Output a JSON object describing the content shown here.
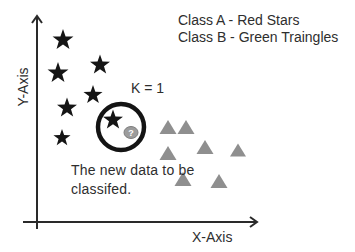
{
  "legend": {
    "class_a": "Class A - Red Stars",
    "class_b": "Class B - Green Traingles"
  },
  "annotations": {
    "k_label": "K = 1",
    "note_line1": "The new data to be",
    "note_line2": "classifed."
  },
  "axes": {
    "x_label": "X-Axis",
    "y_label": "Y-Axis",
    "vertical": {
      "x": 37,
      "top": 16,
      "bottom": 229
    },
    "horizontal": {
      "y": 222,
      "left": 23,
      "right": 257
    }
  },
  "colors": {
    "background": "#ffffff",
    "star": "#151515",
    "triangle": "#8f8f8f",
    "axis": "#2a2a2a",
    "text": "#2e2e2e",
    "circle_stroke": "#141414",
    "badge_fill": "#9c9c9c",
    "badge_stroke": "#7d7d7d",
    "badge_text": "#ffffff"
  },
  "markers": {
    "stars": [
      {
        "x": 63,
        "y": 40,
        "r": 11
      },
      {
        "x": 100,
        "y": 65,
        "r": 10.5
      },
      {
        "x": 58,
        "y": 73,
        "r": 11
      },
      {
        "x": 93,
        "y": 95,
        "r": 10
      },
      {
        "x": 67,
        "y": 108,
        "r": 10.5
      },
      {
        "x": 113,
        "y": 120,
        "r": 10.5
      },
      {
        "x": 62,
        "y": 138,
        "r": 9
      }
    ],
    "triangles": [
      {
        "x": 168,
        "y": 127,
        "w": 17,
        "h": 14
      },
      {
        "x": 186,
        "y": 127,
        "w": 17,
        "h": 14
      },
      {
        "x": 205,
        "y": 147,
        "w": 17,
        "h": 14
      },
      {
        "x": 238,
        "y": 150,
        "w": 16,
        "h": 13
      },
      {
        "x": 168,
        "y": 153,
        "w": 17,
        "h": 14
      },
      {
        "x": 183,
        "y": 179,
        "w": 17,
        "h": 14
      },
      {
        "x": 219,
        "y": 181,
        "w": 17,
        "h": 14
      }
    ],
    "highlight_circle": {
      "cx": 121,
      "cy": 127,
      "r": 23,
      "stroke_width": 4.5
    },
    "question_badge": {
      "cx": 131,
      "cy": 132.5,
      "rx": 7,
      "ry": 6,
      "label": "?"
    }
  }
}
